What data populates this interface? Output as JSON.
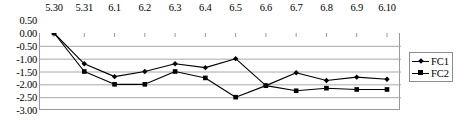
{
  "chart_data": {
    "type": "line",
    "title": "",
    "xlabel": "",
    "ylabel": "",
    "categories": [
      "5.30",
      "5.31",
      "6.1",
      "6.2",
      "6.3",
      "6.4",
      "6.5",
      "6.6",
      "6.7",
      "6.8",
      "6.9",
      "6.10"
    ],
    "yticks": [
      "0.50",
      "0.00",
      "-0.50",
      "-1.00",
      "-1.50",
      "-2.00",
      "-2.50",
      "-3.00"
    ],
    "ytick_values": [
      0.5,
      0.0,
      -0.5,
      -1.0,
      -1.5,
      -2.0,
      -2.5,
      -3.0
    ],
    "ylim": [
      -3.0,
      0.5
    ],
    "grid": true,
    "grid_axis": "y",
    "legend_position": "right",
    "xaxis_position": "top",
    "series": [
      {
        "name": "FC1",
        "marker": "diamond",
        "color": "#000000",
        "values": [
          0.0,
          -1.2,
          -1.7,
          -1.5,
          -1.2,
          -1.35,
          -1.0,
          -2.05,
          -1.55,
          -1.85,
          -1.72,
          -1.8
        ]
      },
      {
        "name": "FC2",
        "marker": "square",
        "color": "#000000",
        "values": [
          0.0,
          -1.5,
          -2.0,
          -2.0,
          -1.5,
          -1.75,
          -2.5,
          -2.05,
          -2.25,
          -2.15,
          -2.2,
          -2.2
        ]
      }
    ]
  },
  "legend": {
    "items": [
      {
        "label": "FC1",
        "marker": "diamond"
      },
      {
        "label": "FC2",
        "marker": "square"
      }
    ]
  },
  "colors": {
    "series": "#000000",
    "grid": "#a8a8a8",
    "border": "#9a9a9a",
    "text": "#000000",
    "background": "#ffffff"
  }
}
